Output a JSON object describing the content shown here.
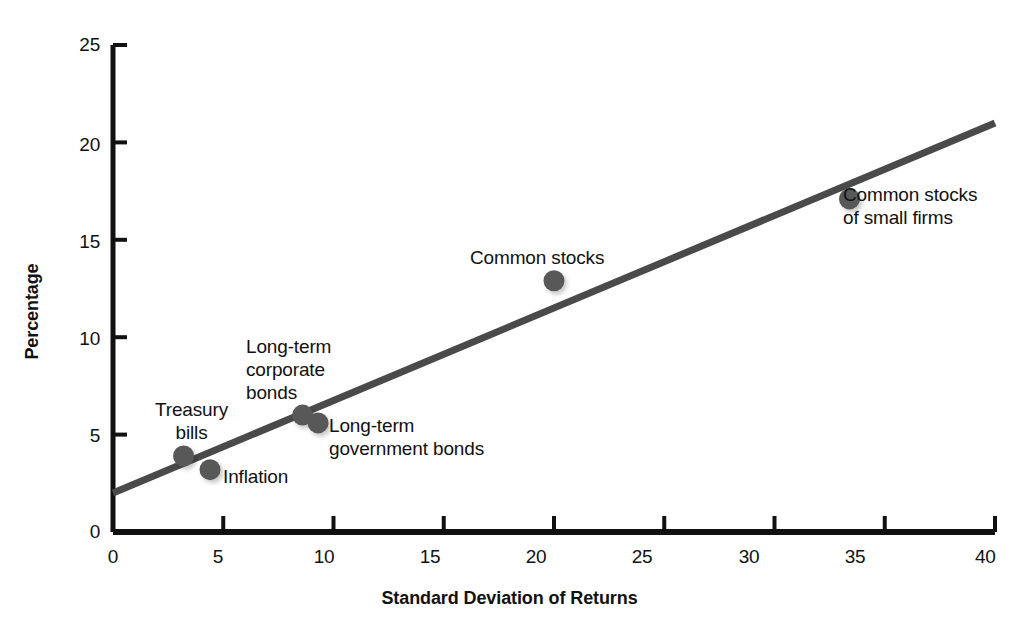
{
  "chart_data": {
    "type": "scatter",
    "title": "",
    "xlabel": "Standard Deviation of Returns",
    "ylabel": "Percentage",
    "xlim": [
      0,
      40
    ],
    "ylim": [
      0,
      25
    ],
    "xticks": [
      "0",
      "5",
      "10",
      "15",
      "20",
      "25",
      "30",
      "35",
      "40"
    ],
    "xtick_values": [
      0,
      5,
      10,
      15,
      20,
      25,
      30,
      35,
      40
    ],
    "yticks": [
      "0",
      "5",
      "10",
      "15",
      "20",
      "25"
    ],
    "ytick_values": [
      0,
      5,
      10,
      15,
      20,
      25
    ],
    "grid": false,
    "legend": "none",
    "point_color": "#585858",
    "line_color": "#4a4a4a",
    "axis_color": "#111111",
    "points": [
      {
        "label": "Treasury\nbills",
        "x": 3.2,
        "y": 3.9,
        "label_align": "center",
        "label_left": 155,
        "label_top": 398
      },
      {
        "label": "Inflation",
        "x": 4.4,
        "y": 3.2,
        "label_align": "left",
        "label_left": 223,
        "label_top": 465
      },
      {
        "label": "Long-term\ncorporate\nbonds",
        "x": 8.6,
        "y": 6.0,
        "label_align": "left",
        "label_top": 335,
        "label_left": 246
      },
      {
        "label": "Long-term\ngovernment bonds",
        "x": 9.3,
        "y": 5.6,
        "label_align": "left",
        "label_left": 329,
        "label_top": 414
      },
      {
        "label": "Common stocks",
        "x": 20.0,
        "y": 12.9,
        "label_align": "center",
        "label_left": 470,
        "label_top": 246
      },
      {
        "label": "Common stocks\nof small firms",
        "x": 33.4,
        "y": 17.1,
        "label_align": "left",
        "label_left": 843,
        "label_top": 183
      }
    ],
    "trendline": {
      "x0": 0,
      "y0": 2.0,
      "x1": 40,
      "y1": 21.0
    }
  }
}
